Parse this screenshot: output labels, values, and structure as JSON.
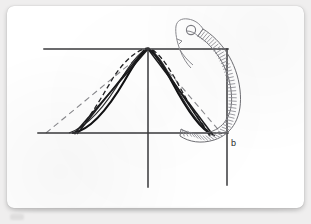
{
  "figure": {
    "background_color": "#efeeee",
    "card_color": "#ffffff",
    "ink_color": "#111113",
    "hatch_color": "#8d8d93",
    "labels": [
      {
        "id": "point-b",
        "text": "b",
        "x": 231,
        "y": 146
      }
    ],
    "geometry": {
      "upper_baseline": {
        "x1": 44,
        "y1": 49,
        "x2": 228,
        "y2": 49
      },
      "lower_baseline": {
        "x1": 38,
        "y1": 133,
        "x2": 228,
        "y2": 133
      },
      "center_ordinate": {
        "x1": 148,
        "y1": 49,
        "x2": 148,
        "y2": 187
      },
      "right_ordinate": {
        "x1": 227,
        "y1": 49,
        "x2": 227,
        "y2": 185
      },
      "apex": {
        "x": 148,
        "y": 49
      },
      "left_foot": {
        "x": 72,
        "y": 133
      },
      "right_foot": {
        "x": 205,
        "y": 133
      },
      "dashed_diagonal": {
        "x1": 46,
        "y1": 133,
        "x2": 227,
        "y2": 133
      }
    },
    "curves": [
      {
        "name": "arch-bold-main",
        "style": "solid-bold"
      },
      {
        "name": "arch-thin-inner",
        "style": "solid-thin"
      },
      {
        "name": "arch-dashed-approx",
        "style": "dashed"
      },
      {
        "name": "diagonal-dashed-left",
        "style": "dashed-gray"
      },
      {
        "name": "diagonal-dashed-right",
        "style": "dashed-gray"
      },
      {
        "name": "chord-left",
        "style": "solid"
      },
      {
        "name": "chord-right",
        "style": "solid"
      }
    ],
    "tool": {
      "name": "flexible-curve-band",
      "hole_center": {
        "x": 205,
        "y": 27
      },
      "hole_radius": 4.6,
      "band_hatch_count": 46
    }
  }
}
